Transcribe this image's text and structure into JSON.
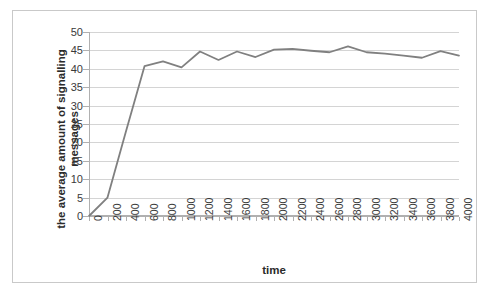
{
  "chart_data": {
    "type": "line",
    "title": "",
    "xlabel": "time",
    "ylabel": "the average amount of signalling messages",
    "ylabel_lines": [
      "the average amount of signalling",
      "messages"
    ],
    "xlim": [
      0,
      4000
    ],
    "ylim": [
      0,
      50
    ],
    "ytick_step": 5,
    "xtick_step": 200,
    "grid": true,
    "legend": false,
    "legend_position": "none",
    "line_color": "#808080",
    "grid_color": "#d4d4d4",
    "background_color": "#ffffff",
    "border_color": "#c9c9c9",
    "xticks": [
      0,
      200,
      400,
      600,
      800,
      1000,
      1200,
      1400,
      1600,
      1800,
      2000,
      2200,
      2400,
      2600,
      2800,
      3000,
      3200,
      3400,
      3600,
      3800,
      4000
    ],
    "yticks": [
      0,
      5,
      10,
      15,
      20,
      25,
      30,
      35,
      40,
      45,
      50
    ],
    "x": [
      0,
      200,
      400,
      600,
      800,
      1000,
      1200,
      1400,
      1600,
      1800,
      2000,
      2200,
      2400,
      2600,
      2800,
      3000,
      3200,
      3400,
      3600,
      3800,
      4000
    ],
    "values": [
      0,
      5,
      23,
      40.7,
      42,
      40.4,
      44.7,
      42.4,
      44.7,
      43.2,
      45.2,
      45.4,
      44.9,
      44.5,
      46.1,
      44.5,
      44.1,
      43.6,
      43,
      44.8,
      43.6
    ],
    "series": [
      {
        "name": "the average amount of signalling messages",
        "values": [
          0,
          5,
          23,
          40.7,
          42,
          40.4,
          44.7,
          42.4,
          44.7,
          43.2,
          45.2,
          45.4,
          44.9,
          44.5,
          46.1,
          44.5,
          44.1,
          43.6,
          43,
          44.8,
          43.6
        ]
      }
    ]
  },
  "axis": {
    "x_title": "time",
    "y_title_line1": "the average amount of signalling",
    "y_title_line2": "messages"
  }
}
